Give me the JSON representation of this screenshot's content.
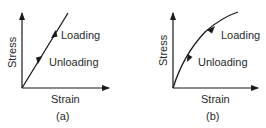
{
  "panels": [
    {
      "id": "a",
      "caption": "(a)",
      "y_label": "Stress",
      "x_label": "Strain",
      "curve_type": "linear",
      "loading_label": "Loading",
      "unloading_label": "Unloading"
    },
    {
      "id": "b",
      "caption": "(b)",
      "y_label": "Stress",
      "x_label": "Strain",
      "curve_type": "nonlinear",
      "loading_label": "Loading",
      "unloading_label": "Unloading"
    }
  ],
  "colors": {
    "line": "#1a1a1a",
    "text": "#2a2a2a",
    "background": "#ffffff"
  }
}
